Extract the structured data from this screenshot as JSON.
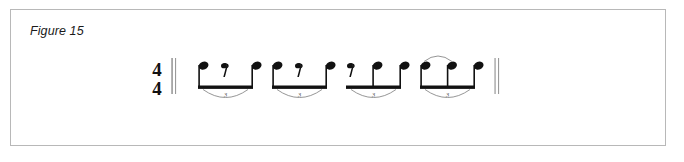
{
  "figure": {
    "label": "Figure 15",
    "border_color": "#b8b8b8",
    "background_color": "#ffffff",
    "ink_color": "#111111"
  },
  "notation": {
    "time_signature": {
      "numerator": "4",
      "denominator": "4"
    },
    "opening_barline": "double-thin",
    "closing_barline": "double-thin",
    "tuplet_number": "3",
    "groups": [
      {
        "name": "triplet-group-1",
        "tuplet": "3",
        "has_tie": false,
        "slots": [
          "note",
          "eighth-rest",
          "note"
        ]
      },
      {
        "name": "triplet-group-2",
        "tuplet": "3",
        "has_tie": false,
        "slots": [
          "note",
          "eighth-rest",
          "note"
        ]
      },
      {
        "name": "triplet-group-3",
        "tuplet": "3",
        "has_tie": false,
        "slots": [
          "eighth-rest",
          "note",
          "note"
        ]
      },
      {
        "name": "triplet-group-4",
        "tuplet": "3",
        "has_tie": true,
        "slots": [
          "note",
          "note",
          "note"
        ]
      }
    ]
  }
}
